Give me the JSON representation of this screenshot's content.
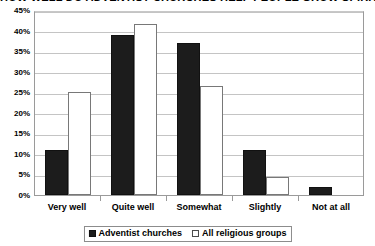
{
  "chart_data": {
    "type": "bar",
    "title": "HOW WELL DO ADVENTIST CHURCHES HELP PEOPLE GROW SPIRITUALLY, MATURE AND ALIVE",
    "xlabel": "",
    "ylabel": "",
    "ylim": [
      0,
      45
    ],
    "ytick_step": 5,
    "ytick_labels": [
      "0%",
      "5%",
      "10%",
      "15%",
      "20%",
      "25%",
      "30%",
      "35%",
      "40%",
      "45%"
    ],
    "grid": true,
    "legend_position": "bottom-center",
    "categories": [
      "Very well",
      "Quite well",
      "Somewhat",
      "Slightly",
      "Not at all"
    ],
    "series": [
      {
        "name": "Adventist churches",
        "color": "#1c1c1c",
        "values": [
          11,
          39,
          37,
          11,
          2
        ]
      },
      {
        "name": "All religious groups",
        "color": "#ffffff",
        "values": [
          25,
          41.5,
          26.5,
          4.5,
          0
        ]
      }
    ]
  }
}
